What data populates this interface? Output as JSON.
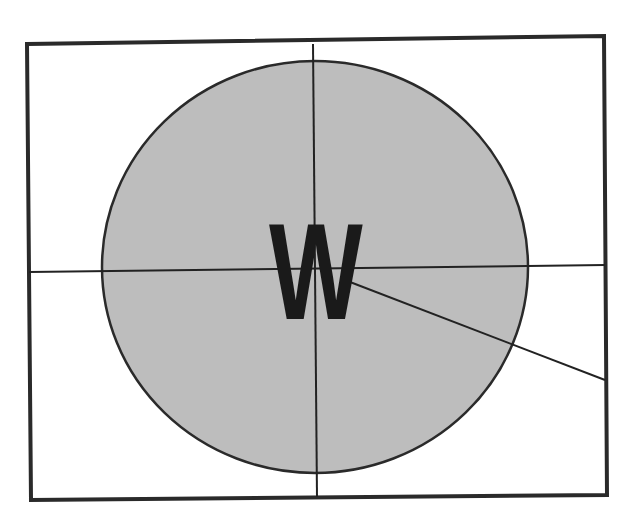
{
  "diagram": {
    "label": "W",
    "colors": {
      "background": "#ffffff",
      "frame_stroke": "#2a2a2a",
      "line_stroke": "#222222",
      "circle_fill": "#bdbdbd",
      "circle_stroke": "#2a2a2a",
      "label_color": "#1a1a1a"
    },
    "frame": {
      "points": "27,44 604,36 607,495 31,500"
    },
    "circle": {
      "cx": 315,
      "cy": 267,
      "rx": 213,
      "ry": 206
    },
    "lines": {
      "vertical": {
        "x1": 313,
        "y1": 44,
        "x2": 317,
        "y2": 497
      },
      "horizontal": {
        "x1": 29,
        "y1": 272,
        "x2": 605,
        "y2": 265
      },
      "diagonal": {
        "x1": 350,
        "y1": 282,
        "x2": 605,
        "y2": 380
      }
    }
  }
}
